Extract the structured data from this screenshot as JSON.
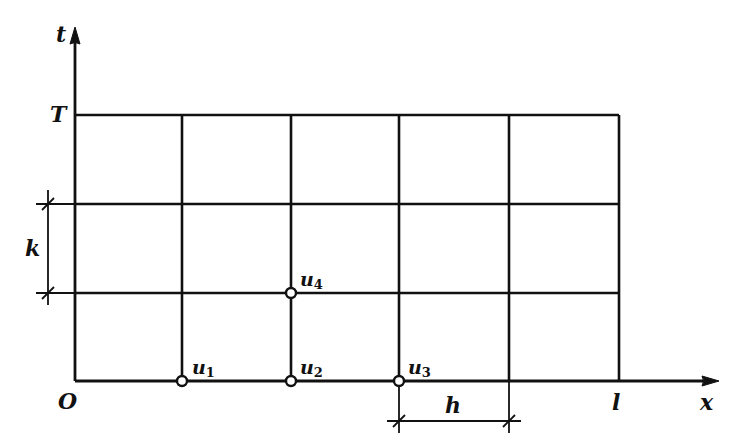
{
  "diagram": {
    "type": "finite-difference-grid",
    "axes": {
      "x_label": "x",
      "t_label": "t",
      "origin_label": "O",
      "x_end_label": "l",
      "t_end_label": "T"
    },
    "grid": {
      "columns": 5,
      "rows": 3
    },
    "dimensions": {
      "h_label": "h",
      "k_label": "k"
    },
    "nodes": [
      {
        "label": "u",
        "sub": "1",
        "col": 1,
        "row": 0
      },
      {
        "label": "u",
        "sub": "2",
        "col": 2,
        "row": 0
      },
      {
        "label": "u",
        "sub": "3",
        "col": 3,
        "row": 0
      },
      {
        "label": "u",
        "sub": "4",
        "col": 2,
        "row": 1
      }
    ],
    "colors": {
      "line": "#111111",
      "background": "#ffffff"
    }
  }
}
